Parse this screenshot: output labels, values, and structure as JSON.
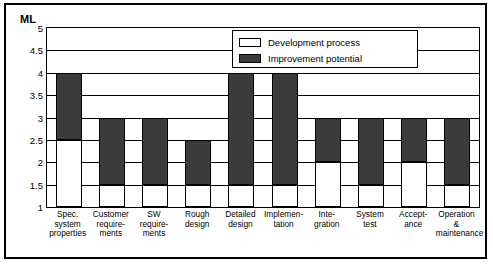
{
  "axis_title": "ML",
  "legend": {
    "items": [
      {
        "label": "Development process",
        "color": "#ffffff",
        "key": "development"
      },
      {
        "label": "Improvement potential",
        "color": "#3b3b3b",
        "key": "improvement"
      }
    ]
  },
  "chart_data": {
    "type": "bar",
    "title": "",
    "xlabel": "",
    "ylabel": "ML",
    "ylim": [
      1,
      5
    ],
    "yticks": [
      "1",
      "1.5",
      "2",
      "2.5",
      "3",
      "3.5",
      "4",
      "4.5",
      "5"
    ],
    "grid": true,
    "legend_position": "top-center-right",
    "stacked": true,
    "categories": [
      "Spec. system properties",
      "Customer require-ments",
      "SW require-ments",
      "Rough design",
      "Detailed design",
      "Implemen-tation",
      "Integration",
      "System test",
      "Accept-ance",
      "Operation & maintenance"
    ],
    "category_lines": [
      [
        "Spec.",
        "system",
        "properties"
      ],
      [
        "Customer",
        "require-",
        "ments"
      ],
      [
        "SW",
        "require-",
        "ments"
      ],
      [
        "Rough",
        "design"
      ],
      [
        "Detailed",
        "design"
      ],
      [
        "Implemen-",
        "tation"
      ],
      [
        "Inte-",
        "gration"
      ],
      [
        "System",
        "test"
      ],
      [
        "Accept-",
        "ance"
      ],
      [
        "Operation &",
        "maintenance"
      ]
    ],
    "series": [
      {
        "name": "Development process",
        "values": [
          2.5,
          1.5,
          1.5,
          1.5,
          1.5,
          1.5,
          2.0,
          1.5,
          2.0,
          1.5
        ]
      },
      {
        "name": "Improvement potential",
        "values": [
          4.0,
          3.0,
          3.0,
          2.5,
          4.0,
          4.0,
          3.0,
          3.0,
          3.0,
          3.0
        ]
      }
    ]
  }
}
